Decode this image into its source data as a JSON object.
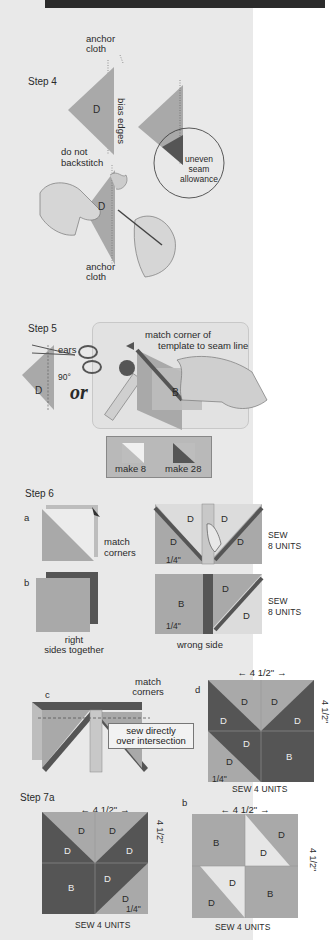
{
  "page": {
    "banner_text": "",
    "colors": {
      "panel_bg": "#e9e9e9",
      "page_bg": "#ffffff",
      "banner": "#2b2b2b",
      "fabric_d_light": "#a9a9a9",
      "fabric_d_dark": "#555555",
      "fabric_b": "#8c8c8c",
      "fabric_light": "#dcdcdc"
    }
  },
  "step4": {
    "title": "Step 4",
    "anchor_cloth_top": "anchor\ncloth",
    "anchor_cloth_line1": "anchor",
    "anchor_cloth_line2": "cloth",
    "bias_edges": "bias edges",
    "triangle_label": "D",
    "do_not_line1": "do not",
    "do_not_line2": "backstitch",
    "uneven_line1": "uneven",
    "uneven_line2": "seam",
    "uneven_line3": "allowance",
    "sewing_label": "D",
    "anchor_bottom_line1": "anchor",
    "anchor_bottom_line2": "cloth"
  },
  "step5": {
    "title": "Step 5",
    "ears": "ears",
    "angle": "90°",
    "or": "or",
    "triangle_label": "D",
    "match_line1": "match corner of",
    "match_line2": "template to seam line",
    "template_label": "B",
    "make_a": "make 8",
    "make_b": "make 28"
  },
  "step6": {
    "title": "Step 6",
    "a_label": "a",
    "b_label": "b",
    "match_line1": "match",
    "match_line2": "corners",
    "a_cells": [
      "D",
      "D",
      "D",
      "D"
    ],
    "a_quarter": "1/4\"",
    "a_sew_line1": "SEW",
    "a_sew_line2": "8 UNITS",
    "b_right_line1": "right",
    "b_right_line2": "sides together",
    "b_cells": [
      "B",
      "D",
      "D"
    ],
    "b_quarter": "1/4\"",
    "b_wrong_side": "wrong side",
    "b_sew_line1": "SEW",
    "b_sew_line2": "8 UNITS",
    "c_label": "c",
    "c_match_line1": "match",
    "c_match_line2": "corners",
    "c_note_line1": "sew directly",
    "c_note_line2": "over intersection",
    "d_label": "d",
    "d_width": "4 1/2\"",
    "d_height": "4 1/2\"",
    "d_cells": [
      "D",
      "D",
      "D",
      "D",
      "D",
      "D",
      "B"
    ],
    "d_quarter": "1/4\"",
    "d_sew": "SEW 4 UNITS"
  },
  "step7": {
    "title": "Step 7a",
    "a_width": "4 1/2\"",
    "a_height": "4 1/2\"",
    "a_cells": [
      "D",
      "D",
      "D",
      "D",
      "B",
      "D",
      "D"
    ],
    "a_quarter": "1/4\"",
    "a_sew": "SEW 4 UNITS",
    "b_label": "b",
    "b_width": "4 1/2\"",
    "b_height": "4 1/2\"",
    "b_cells": [
      "B",
      "D",
      "D",
      "D",
      "D",
      "B"
    ],
    "b_sew": "SEW 4 UNITS"
  }
}
